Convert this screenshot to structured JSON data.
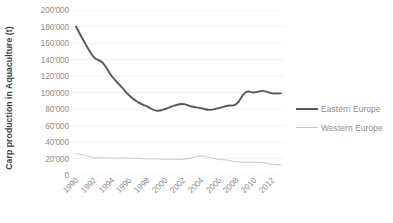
{
  "chart_data": {
    "type": "line",
    "title": "",
    "xlabel": "",
    "ylabel": "Carp production in Aquaculture (t)",
    "ylim": [
      0,
      200000
    ],
    "ytick_values": [
      0,
      20000,
      40000,
      60000,
      80000,
      100000,
      120000,
      140000,
      160000,
      180000,
      200000
    ],
    "ytick_labels": [
      "0",
      "20'000",
      "40'000",
      "60'000",
      "80'000",
      "100'000",
      "120'000",
      "140'000",
      "160'000",
      "180'000",
      "200'000"
    ],
    "xtick_labels": [
      "1990",
      "1992",
      "1994",
      "1996",
      "1998",
      "2000",
      "2002",
      "2004",
      "2006",
      "2008",
      "2010",
      "2012"
    ],
    "x": [
      1990,
      1991,
      1992,
      1993,
      1994,
      1995,
      1996,
      1997,
      1998,
      1999,
      2000,
      2001,
      2002,
      2003,
      2004,
      2005,
      2006,
      2007,
      2008,
      2009,
      2010,
      2011,
      2012,
      2013
    ],
    "grid": true,
    "legend_position": "right",
    "series": [
      {
        "name": "Eastern Europe",
        "color": "#595959",
        "values": [
          180000,
          160000,
          143000,
          136000,
          120000,
          108000,
          96000,
          88000,
          83000,
          78000,
          80000,
          84000,
          86000,
          83000,
          81000,
          79000,
          81000,
          84000,
          86000,
          100000,
          100000,
          102000,
          99000,
          99000
        ]
      },
      {
        "name": "Western Europe",
        "color": "#c6c6c6",
        "values": [
          26000,
          24000,
          21000,
          21000,
          20500,
          20500,
          20500,
          20000,
          19500,
          19500,
          19000,
          19000,
          19000,
          21000,
          23000,
          21000,
          19000,
          18000,
          16000,
          15500,
          15500,
          15000,
          13000,
          12000
        ]
      }
    ]
  },
  "legend": {
    "items": [
      {
        "label": "Eastern Europe"
      },
      {
        "label": "Western Europe"
      }
    ]
  },
  "axis": {
    "y_title": "Carp production in Aquaculture (t)"
  }
}
